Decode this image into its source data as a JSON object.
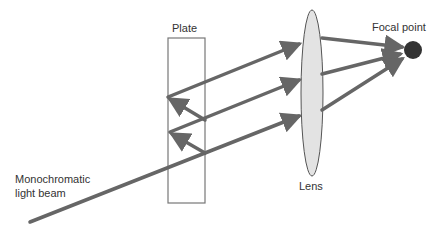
{
  "diagram": {
    "labels": {
      "plate": "Plate",
      "lens": "Lens",
      "focal_point": "Focal point",
      "beam_line1": "Monochromatic",
      "beam_line2": "light beam"
    },
    "colors": {
      "beam": "#666666",
      "plate_outline": "#777777",
      "lens_fill": "#e3e3e3",
      "lens_outline": "#555555",
      "focal_point": "#333333",
      "text": "#333333"
    }
  }
}
